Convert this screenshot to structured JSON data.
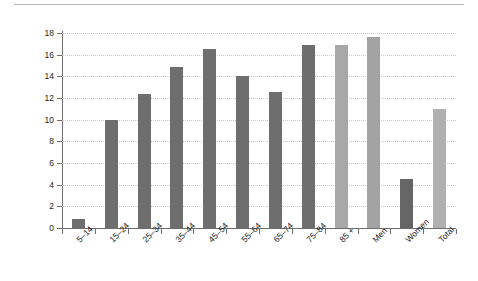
{
  "chart_data": {
    "type": "bar",
    "title": "",
    "subtitle": "",
    "xlabel": "",
    "ylabel": "Suicides per 100,000 population",
    "ylim": [
      0,
      18
    ],
    "ytick_labels": [
      "0",
      "2",
      "4",
      "6",
      "8",
      "10",
      "12",
      "14",
      "16",
      "18"
    ],
    "ytick_values": [
      0,
      2,
      4,
      6,
      8,
      10,
      12,
      14,
      16,
      18
    ],
    "grid": true,
    "legend": "none",
    "categories": [
      "5–14",
      "15–24",
      "25–34",
      "35–44",
      "45–54",
      "55–64",
      "65–74",
      "75–84",
      "85 +",
      "Men",
      "Women",
      "Total"
    ],
    "values": [
      0.8,
      10.0,
      12.4,
      14.9,
      16.5,
      14.0,
      12.6,
      16.9,
      16.9,
      17.6,
      4.5,
      11.0
    ],
    "bar_colors": [
      "#6e6e6e",
      "#6e6e6e",
      "#6e6e6e",
      "#6e6e6e",
      "#6e6e6e",
      "#6e6e6e",
      "#6e6e6e",
      "#6e6e6e",
      "#a8a8a8",
      "#a3a3a3",
      "#666666",
      "#b0b0b0"
    ],
    "series": [
      {
        "name": "Suicide rate",
        "values": [
          0.8,
          10.0,
          12.4,
          14.9,
          16.5,
          14.0,
          12.6,
          16.9,
          16.9,
          17.6,
          4.5,
          11.0
        ]
      }
    ]
  }
}
